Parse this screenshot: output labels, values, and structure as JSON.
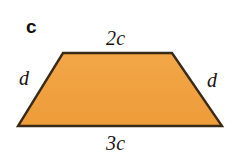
{
  "figure": {
    "part_label": "c",
    "shape_name": "trapezoid",
    "fill_color": "#f0a03f",
    "stroke_color": "#3a2a18",
    "background_color": "#ffffff",
    "labels": {
      "top_side": "2c",
      "bottom_side": "3c",
      "left_side": "d",
      "right_side": "d"
    },
    "vertices": {
      "top_left": [
        63,
        53
      ],
      "top_right": [
        172,
        53
      ],
      "bottom_right": [
        222,
        126
      ],
      "bottom_left": [
        18,
        126
      ]
    }
  }
}
